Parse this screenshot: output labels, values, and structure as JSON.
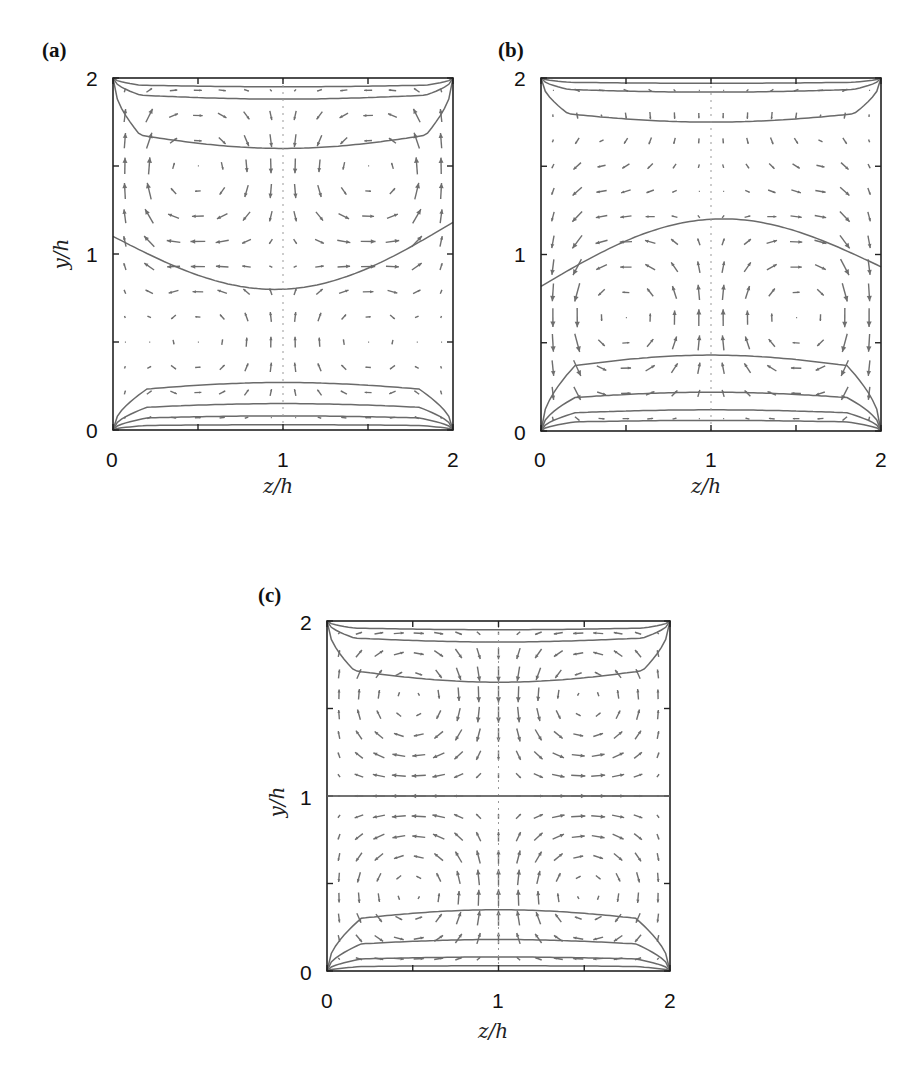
{
  "figure": {
    "panels": [
      {
        "id": "a",
        "label": "(a)",
        "box": {
          "x0": 113,
          "y0": 78,
          "x1": 453,
          "y1": 430
        },
        "label_pos": {
          "x": 42,
          "y": 38
        }
      },
      {
        "id": "b",
        "label": "(b)",
        "box": {
          "x0": 541,
          "y0": 78,
          "x1": 881,
          "y1": 431
        },
        "label_pos": {
          "x": 498,
          "y": 38
        }
      },
      {
        "id": "c",
        "label": "(c)",
        "box": {
          "x0": 327,
          "y0": 621,
          "x1": 670,
          "y1": 971
        },
        "label_pos": {
          "x": 255,
          "y": 583
        }
      }
    ],
    "colors": {
      "arrow": "#6e6e6e",
      "contour": "#6a6a6a",
      "axis": "#222222",
      "text": "#111111"
    }
  },
  "chart_data": [
    {
      "type": "quiver",
      "panel": "(a)",
      "title": "",
      "xlabel": "z/h",
      "ylabel": "y/h",
      "xlim": [
        0,
        2
      ],
      "ylim": [
        0,
        2
      ],
      "xticks": [
        0,
        1,
        2
      ],
      "yticks": [
        0,
        1,
        2
      ],
      "minor_ticks": [
        0.5,
        1.5
      ],
      "grid": false,
      "description": "Secondary-flow vector field with streamwise-velocity contours; two counter-rotating cells in upper half, upward flow near side walls, downward jet at z/h=1",
      "vortex_centers": [
        [
          0.5,
          1.45
        ],
        [
          1.5,
          1.45
        ],
        [
          0.5,
          0.55
        ],
        [
          1.5,
          0.55
        ]
      ],
      "contours_y_at_center": [
        1.95,
        1.88,
        1.6,
        0.8,
        0.27,
        0.15,
        0.08,
        0.03
      ],
      "contour_mid_level": {
        "y_at_z0": 1.1,
        "y_at_center": 0.8,
        "y_at_z2": 1.18
      }
    },
    {
      "type": "quiver",
      "panel": "(b)",
      "title": "",
      "xlabel": "z/h",
      "ylabel": "y/h",
      "xlim": [
        0,
        2
      ],
      "ylim": [
        0,
        2
      ],
      "xticks": [
        0,
        1,
        2
      ],
      "yticks": [
        0,
        1,
        2
      ],
      "minor_ticks": [
        0.5,
        1.5
      ],
      "grid": false,
      "description": "Secondary-flow vector field; upward jet at z/h=1, downward flow near side walls, corner vortices at top",
      "vortex_centers": [
        [
          0.5,
          0.6
        ],
        [
          1.5,
          0.6
        ],
        [
          0.3,
          1.75
        ],
        [
          1.7,
          1.75
        ]
      ],
      "contours_y_at_center": [
        1.97,
        1.92,
        1.75,
        1.2,
        0.43,
        0.22,
        0.12,
        0.06
      ],
      "contour_mid_level": {
        "y_at_z0": 0.82,
        "y_at_center": 1.2,
        "y_at_z2": 0.93
      }
    },
    {
      "type": "quiver",
      "panel": "(c)",
      "title": "",
      "xlabel": "z/h",
      "ylabel": "y/h",
      "xlim": [
        0,
        2
      ],
      "ylim": [
        0,
        2
      ],
      "xticks": [
        0,
        1,
        2
      ],
      "yticks": [
        0,
        1,
        2
      ],
      "minor_ticks": [
        0.5,
        1.5
      ],
      "grid": false,
      "description": "Symmetric four-cell secondary flow; downward jet in upper half and upward jet in lower half at z/h=1, flat contour at y/h=1",
      "vortex_centers": [
        [
          0.5,
          1.55
        ],
        [
          1.5,
          1.55
        ],
        [
          0.5,
          0.45
        ],
        [
          1.5,
          0.45
        ]
      ],
      "contours_y_at_center": [
        1.95,
        1.88,
        1.65,
        1.0,
        0.35,
        0.18,
        0.08,
        0.03
      ],
      "contour_mid_level": {
        "y_at_z0": 1.0,
        "y_at_center": 1.0,
        "y_at_z2": 1.0
      }
    }
  ]
}
